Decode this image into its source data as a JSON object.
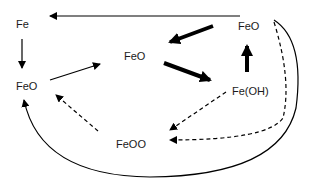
{
  "diagram": {
    "nodes": [
      {
        "id": "fe",
        "label": "Fe"
      },
      {
        "id": "feo_left",
        "label": "FeO"
      },
      {
        "id": "feo_center",
        "label": "FeO"
      },
      {
        "id": "feo_top_right",
        "label": "FeO"
      },
      {
        "id": "feoh",
        "label": "Fe(OH)"
      },
      {
        "id": "feoo",
        "label": "FeOO"
      }
    ],
    "edges": [
      {
        "from": "feo_top_right",
        "to": "fe",
        "style": "solid-thin"
      },
      {
        "from": "fe",
        "to": "feo_left",
        "style": "solid-thin"
      },
      {
        "from": "feo_left",
        "to": "feo_center",
        "style": "solid-thin"
      },
      {
        "from": "feo_top_right",
        "to": "feo_center",
        "style": "solid-thick"
      },
      {
        "from": "feo_center",
        "to": "feoh",
        "style": "solid-thick"
      },
      {
        "from": "feoh",
        "to": "feo_top_right",
        "style": "solid-thick"
      },
      {
        "from": "feoh",
        "to": "feoo",
        "style": "dashed"
      },
      {
        "from": "feo_top_right",
        "to": "feoo",
        "style": "dashed-curve"
      },
      {
        "from": "feoo",
        "to": "feo_left",
        "style": "dashed"
      },
      {
        "from": "feo_top_right",
        "to": "feo_left",
        "style": "solid-curve"
      }
    ]
  }
}
